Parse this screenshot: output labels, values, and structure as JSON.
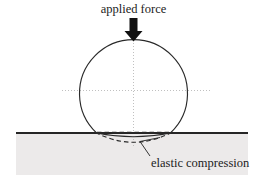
{
  "figure": {
    "title": "applied force",
    "caption": "elastic compression",
    "colors": {
      "outline": "#2a2a2a",
      "ground": "#262626",
      "substrate_fill": "#eceaea",
      "axis_dotted": "#b9b9b9",
      "arrow_fill": "#111111",
      "text": "#1c1c1c",
      "background": "#ffffff"
    },
    "elements": {
      "arrow_name": "applied-force-arrow",
      "sphere_name": "deformed-sphere",
      "ground_name": "substrate-surface-line",
      "contact_chord_name": "contact-flat-dashed",
      "undeformed_arc_name": "undeformed-sphere-dashed-arc",
      "vertical_axis_name": "vertical-center-axis",
      "horizontal_axis_name": "horizontal-center-axis",
      "leader_name": "caption-leader-line"
    },
    "geometry": {
      "circle_center_x": 133.5,
      "circle_center_y": 93,
      "circle_radius": 54,
      "ground_y": 133,
      "ground_x_start": 16,
      "ground_x_end": 248,
      "contact_half_width": 37,
      "solid_bulge_depth": 6,
      "dashed_bulge_depth": 12
    }
  }
}
